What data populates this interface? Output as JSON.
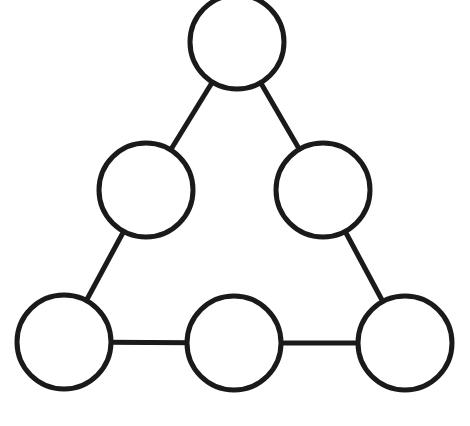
{
  "diagram": {
    "type": "triangle-node-graph",
    "stroke_color": "#1a1a1a",
    "fill_color": "#ffffff",
    "node_radius": 47,
    "stroke_width": 5,
    "nodes": [
      {
        "id": "top",
        "cx": 237,
        "cy": 42,
        "label": ""
      },
      {
        "id": "mid-left",
        "cx": 146,
        "cy": 190,
        "label": ""
      },
      {
        "id": "mid-right",
        "cx": 323,
        "cy": 190,
        "label": ""
      },
      {
        "id": "bottom-left",
        "cx": 64,
        "cy": 342,
        "label": ""
      },
      {
        "id": "bottom-mid",
        "cx": 234,
        "cy": 343,
        "label": ""
      },
      {
        "id": "bottom-right",
        "cx": 405,
        "cy": 343,
        "label": ""
      }
    ],
    "edges": [
      [
        "top",
        "mid-left"
      ],
      [
        "top",
        "mid-right"
      ],
      [
        "mid-left",
        "bottom-left"
      ],
      [
        "mid-right",
        "bottom-right"
      ],
      [
        "bottom-left",
        "bottom-mid"
      ],
      [
        "bottom-mid",
        "bottom-right"
      ]
    ]
  }
}
